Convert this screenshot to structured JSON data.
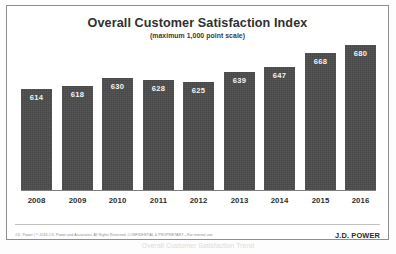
{
  "chart_data": {
    "type": "bar",
    "title": "Overall Customer Satisfaction Index",
    "subtitle": "(maximum 1,000 point scale)",
    "categories": [
      "2008",
      "2009",
      "2010",
      "2011",
      "2012",
      "2013",
      "2014",
      "2015",
      "2016"
    ],
    "values": [
      614,
      618,
      630,
      628,
      625,
      639,
      647,
      668,
      680
    ],
    "xlabel": "",
    "ylabel": "",
    "ylim": [
      0,
      1000
    ],
    "axis_visible": {
      "x": true,
      "y": false
    },
    "grid": false,
    "legend": null,
    "data_labels": true,
    "bar_color": "#4b4b4b",
    "data_label_color": "#f2f2f2"
  },
  "footer": {
    "legal": "J.D. Power  |  © 2016 J.D. Power and Associates. All Rights Reserved. CONFIDENTIAL & PROPRIETARY—For internal use",
    "logo": "J.D. POWER"
  },
  "scan_caption": "Overall Customer Satisfaction Trend"
}
